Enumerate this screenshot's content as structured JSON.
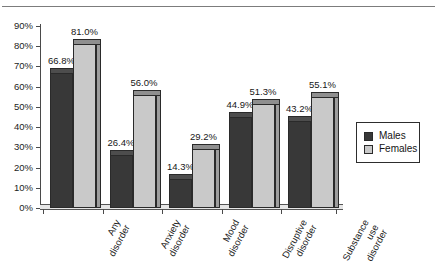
{
  "chart_data": {
    "type": "bar",
    "title": "",
    "subtitle": "",
    "xlabel": "",
    "ylabel": "",
    "categories": [
      "Any disorder",
      "Anxiety disorder",
      "Mood disorder",
      "Disruptive disorder",
      "Substance use disorder"
    ],
    "category_lines": [
      [
        "Any",
        "disorder"
      ],
      [
        "Anxiety",
        "disorder"
      ],
      [
        "Mood",
        "disorder"
      ],
      [
        "Disruptive",
        "disorder"
      ],
      [
        "Substance",
        "use",
        "disorder"
      ]
    ],
    "series": [
      {
        "name": "Males",
        "color": "#383838",
        "values": [
          66.8,
          26.4,
          14.3,
          44.9,
          43.2
        ],
        "labels": [
          "66.8%",
          "26.4%",
          "14.3%",
          "44.9%",
          "43.2%"
        ]
      },
      {
        "name": "Females",
        "color": "#c9c9c9",
        "values": [
          81.0,
          56.0,
          29.2,
          51.3,
          55.1
        ],
        "labels": [
          "81.0%",
          "56.0%",
          "29.2%",
          "51.3%",
          "55.1%"
        ]
      }
    ],
    "ylim": [
      0,
      90
    ],
    "ytick_values": [
      0,
      10,
      20,
      30,
      40,
      50,
      60,
      70,
      80,
      90
    ],
    "ytick_labels": [
      "0%",
      "10%",
      "20%",
      "30%",
      "40%",
      "50%",
      "60%",
      "70%",
      "80%",
      "90%"
    ],
    "grid": false,
    "legend_position": "right",
    "legend_entries": [
      "Males",
      "Females"
    ]
  }
}
